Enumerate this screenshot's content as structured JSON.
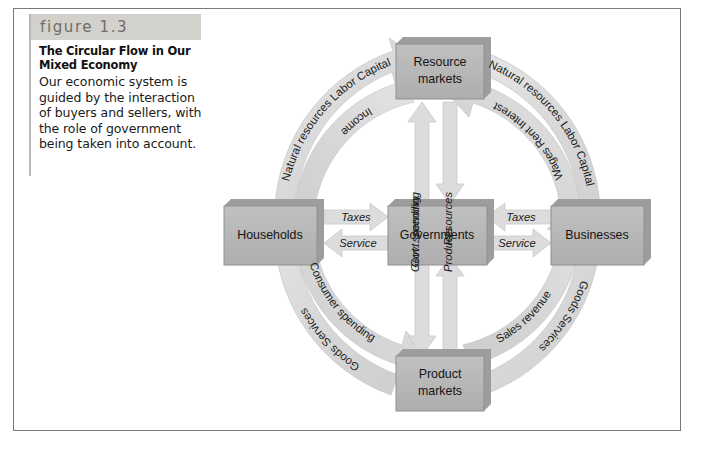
{
  "figure": {
    "band_label": "figure 1.3",
    "title": "The Circular Flow in Our Mixed Economy",
    "body": "Our economic system is guided by the interaction of buyers and sellers, with the role of government being taken into account."
  },
  "colors": {
    "band_background": "#d3d1cc",
    "band_text": "#6f6d69",
    "node_fill": "#b5b5b5",
    "node_shadow": "#9a9a9a",
    "node_edge": "#8f8f8f",
    "arrow_fill": "#d9d9d9",
    "arrow_edge": "#c6c6c6",
    "text": "#1a1a1a",
    "frame": "#7a7a7a",
    "page_background": "#ffffff"
  },
  "diagram": {
    "type": "circular-flow",
    "nodes": [
      {
        "id": "resource-markets",
        "label_line1": "Resource",
        "label_line2": "markets",
        "position": "top"
      },
      {
        "id": "households",
        "label_line1": "Households",
        "label_line2": "",
        "position": "left"
      },
      {
        "id": "governments",
        "label_line1": "Governments",
        "label_line2": "",
        "position": "center"
      },
      {
        "id": "businesses",
        "label_line1": "Businesses",
        "label_line2": "",
        "position": "right"
      },
      {
        "id": "product-markets",
        "label_line1": "Product",
        "label_line2": "markets",
        "position": "bottom"
      }
    ],
    "cross_flows": [
      {
        "id": "households-to-governments",
        "label": "Taxes",
        "from": "households",
        "to": "governments",
        "direction": "right"
      },
      {
        "id": "governments-to-households",
        "label": "Service",
        "from": "governments",
        "to": "households",
        "direction": "left"
      },
      {
        "id": "businesses-to-governments",
        "label": "Taxes",
        "from": "businesses",
        "to": "governments",
        "direction": "left"
      },
      {
        "id": "governments-to-businesses",
        "label": "Service",
        "from": "governments",
        "to": "businesses",
        "direction": "right"
      },
      {
        "id": "governments-to-resource",
        "label": "Govt. spending",
        "from": "governments",
        "to": "resource-markets",
        "direction": "up"
      },
      {
        "id": "resource-to-governments",
        "label": "Resources",
        "from": "resource-markets",
        "to": "governments",
        "direction": "down"
      },
      {
        "id": "governments-to-product",
        "label": "Govt. spending",
        "from": "governments",
        "to": "product-markets",
        "direction": "down"
      },
      {
        "id": "product-to-governments",
        "label": "Products",
        "from": "product-markets",
        "to": "governments",
        "direction": "up"
      }
    ],
    "arc_flows": [
      {
        "id": "households-to-resource-outer",
        "quadrant": "upper-left",
        "ring": "outer",
        "label": "Natural resources  Labor  Capital",
        "from": "households",
        "to": "resource-markets"
      },
      {
        "id": "resource-to-households-inner",
        "quadrant": "upper-left",
        "ring": "inner",
        "label": "Income",
        "from": "resource-markets",
        "to": "households"
      },
      {
        "id": "resource-to-businesses-outer",
        "quadrant": "upper-right",
        "ring": "outer",
        "label": "Natural resources  Labor  Capital",
        "from": "resource-markets",
        "to": "businesses"
      },
      {
        "id": "businesses-to-resource-inner",
        "quadrant": "upper-right",
        "ring": "inner",
        "label": "Wages  Rent  Interest",
        "from": "businesses",
        "to": "resource-markets"
      },
      {
        "id": "households-to-product-inner",
        "quadrant": "lower-left",
        "ring": "inner",
        "label": "Consumer spending",
        "from": "households",
        "to": "product-markets"
      },
      {
        "id": "product-to-households-outer",
        "quadrant": "lower-left",
        "ring": "outer",
        "label": "Goods    Services",
        "from": "product-markets",
        "to": "households"
      },
      {
        "id": "product-to-businesses-inner",
        "quadrant": "lower-right",
        "ring": "inner",
        "label": "Sales revenue",
        "from": "product-markets",
        "to": "businesses"
      },
      {
        "id": "businesses-to-product-outer",
        "quadrant": "lower-right",
        "ring": "outer",
        "label": "Goods    Services",
        "from": "businesses",
        "to": "product-markets"
      }
    ]
  }
}
